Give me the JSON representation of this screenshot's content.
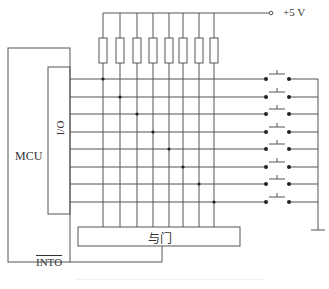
{
  "diagram": {
    "type": "circuit-schematic",
    "title": "",
    "labels": {
      "mcu": "MCU",
      "io": "I/O",
      "supply": "+5 V",
      "and_gate": "与门",
      "interrupt_pin": "INTO"
    },
    "components": {
      "pullup_resistors": 8,
      "push_buttons": 8,
      "io_lines": 8,
      "and_gate": 1,
      "ground_symbol": 1
    },
    "geometry": {
      "column_x": [
        103,
        120,
        137,
        153,
        169,
        183,
        199,
        214
      ],
      "row_y": [
        79,
        97,
        114,
        132,
        149,
        167,
        184,
        202
      ],
      "rail_y": 13,
      "resistor_top": 38,
      "resistor_bottom": 63
    },
    "colors": {
      "line": "#555555",
      "text": "#333333",
      "background": "#ffffff"
    }
  }
}
